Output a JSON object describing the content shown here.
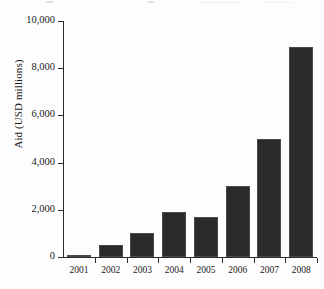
{
  "chart_data": {
    "type": "bar",
    "title": "",
    "xlabel": "",
    "ylabel": "Aid (USD millions)",
    "categories": [
      "2001",
      "2002",
      "2003",
      "2004",
      "2005",
      "2006",
      "2007",
      "2008"
    ],
    "values": [
      100,
      500,
      1000,
      1900,
      1700,
      3000,
      5000,
      8900
    ],
    "ylim": [
      0,
      10000
    ],
    "ytick_values": [
      0,
      2000,
      4000,
      6000,
      8000,
      10000
    ],
    "ytick_labels": [
      "0",
      "2,000",
      "4,000",
      "6,000",
      "8,000",
      "10,000"
    ],
    "grid": false,
    "legend": false,
    "bar_color": "#2a2a2a",
    "axis_color": "#2b2b2b",
    "background_color": "#ffffff"
  }
}
